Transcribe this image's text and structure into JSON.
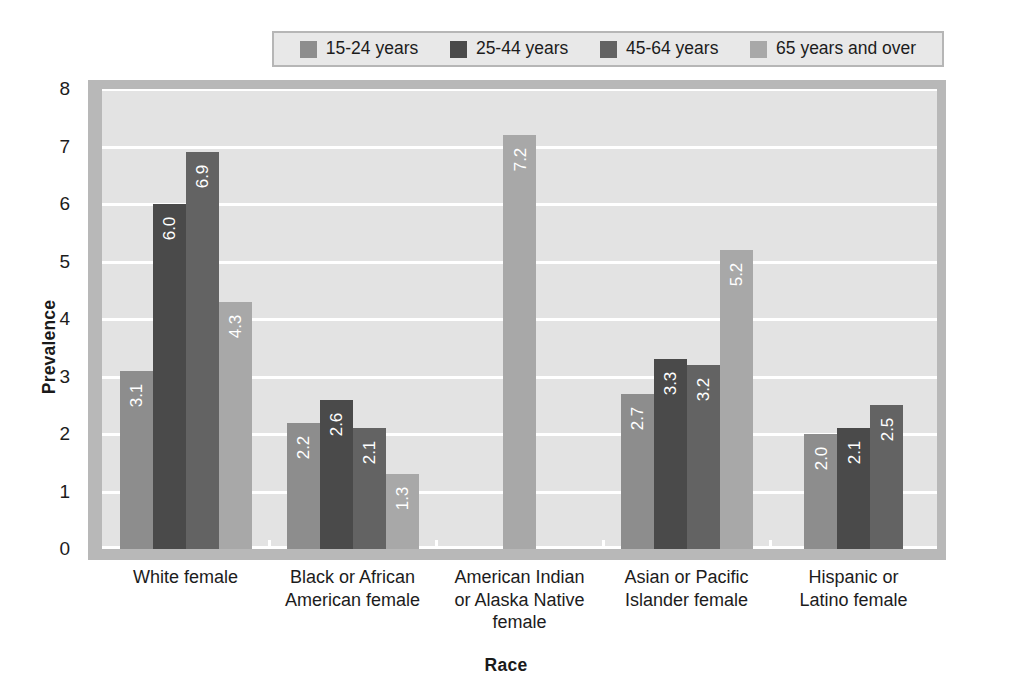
{
  "chart_data": {
    "type": "bar",
    "title": "",
    "xlabel": "Race",
    "ylabel": "Prevalence",
    "ylim": [
      0,
      8
    ],
    "yticks": [
      "0",
      "1",
      "2",
      "3",
      "4",
      "5",
      "6",
      "7",
      "8"
    ],
    "grid": true,
    "legend_position": "top",
    "categories": [
      "White female",
      "Black or African American female",
      "American Indian or Alaska Native female",
      "Asian or Pacific Islander female",
      "Hispanic or Latino female"
    ],
    "category_lines": [
      [
        "White female"
      ],
      [
        "Black or African",
        "American female"
      ],
      [
        "American Indian",
        "or Alaska Native",
        "female"
      ],
      [
        "Asian or Pacific",
        "Islander female"
      ],
      [
        "Hispanic or",
        "Latino female"
      ]
    ],
    "series": [
      {
        "name": "15-24 years",
        "color": "#8d8d8d",
        "values": [
          3.1,
          2.2,
          null,
          2.7,
          2.0
        ],
        "labels": [
          "3.1",
          "2.2",
          "",
          "2.7",
          "2.0"
        ]
      },
      {
        "name": "25-44 years",
        "color": "#4a4a4a",
        "values": [
          6.0,
          2.6,
          null,
          3.3,
          2.1
        ],
        "labels": [
          "6.0",
          "2.6",
          "",
          "3.3",
          "2.1"
        ]
      },
      {
        "name": "45-64 years",
        "color": "#636363",
        "values": [
          6.9,
          2.1,
          null,
          3.2,
          2.5
        ],
        "labels": [
          "6.9",
          "2.1",
          "",
          "3.2",
          "2.5"
        ]
      },
      {
        "name": "65 years and over",
        "color": "#a8a8a8",
        "values": [
          4.3,
          1.3,
          7.2,
          5.2,
          null
        ],
        "labels": [
          "4.3",
          "1.3",
          "7.2",
          "5.2",
          ""
        ]
      }
    ]
  },
  "legend": {
    "items": [
      {
        "label": "15-24 years",
        "color": "#8d8d8d"
      },
      {
        "label": "25-44 years",
        "color": "#4a4a4a"
      },
      {
        "label": "45-64 years",
        "color": "#636363"
      },
      {
        "label": "65 years and over",
        "color": "#a8a8a8"
      }
    ]
  },
  "colors": {
    "plot_background": "#e3e3e3",
    "frame": "#b8b8b8",
    "gridline": "#ffffff",
    "page_background": "#ffffff",
    "text": "#1c1c1c"
  }
}
